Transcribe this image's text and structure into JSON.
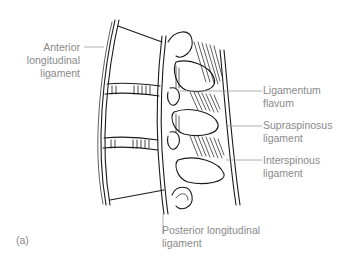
{
  "figure": {
    "panel_label": "(a)",
    "labels": {
      "anterior_longitudinal": [
        "Anterior",
        "longitudinal",
        "ligament"
      ],
      "ligamentum_flavum": [
        "Ligamentum",
        "flavum"
      ],
      "supraspinosus": [
        "Supraspinosus",
        "ligament"
      ],
      "interspinous": [
        "Interspinous",
        "ligament"
      ],
      "posterior_longitudinal": [
        "Posterior longitudinal",
        "ligament"
      ]
    },
    "colors": {
      "label_text": "#8a8a8a",
      "leader_line": "#9a9a9a",
      "drawing": "#1a1a1a"
    }
  }
}
